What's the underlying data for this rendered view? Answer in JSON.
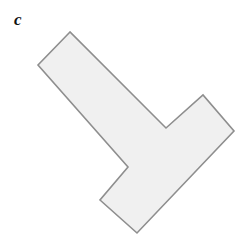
{
  "figure": {
    "panel_label": "c",
    "background_color": "#ffffff",
    "width": 242,
    "height": 245
  },
  "shape": {
    "name": "chevron-polygon",
    "description": "rotated L-shaped hexagon",
    "fill_color": "#f0f0f0",
    "stroke_color": "#8e8e8e",
    "stroke_width": 1.6,
    "vertex_count": 8,
    "points": "70,32 38,65 128,167 100,200 137,233 234,131 203,95 166,128",
    "vertices": [
      {
        "label": "top",
        "x": 70,
        "y": 32,
        "type": "convex"
      },
      {
        "label": "upper-left",
        "x": 38,
        "y": 65,
        "type": "convex"
      },
      {
        "label": "inner-left-notch",
        "x": 128,
        "y": 167,
        "type": "convex"
      },
      {
        "label": "bottom-left",
        "x": 100,
        "y": 200,
        "type": "convex"
      },
      {
        "label": "bottom",
        "x": 137,
        "y": 233,
        "type": "convex"
      },
      {
        "label": "far-right",
        "x": 234,
        "y": 131,
        "type": "convex"
      },
      {
        "label": "upper-right",
        "x": 203,
        "y": 95,
        "type": "convex"
      },
      {
        "label": "inner-v-notch",
        "x": 166,
        "y": 128,
        "type": "concave"
      }
    ]
  }
}
